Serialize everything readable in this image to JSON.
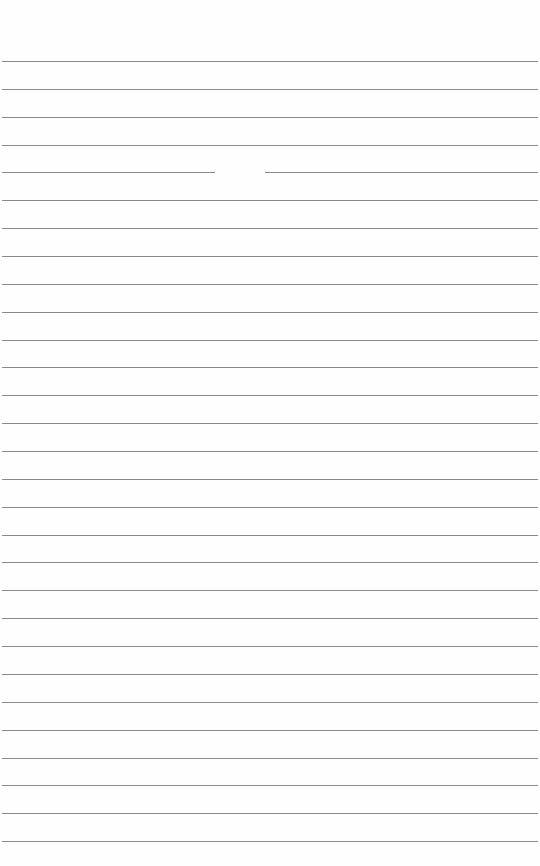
{
  "page": {
    "type": "lined-paper",
    "background_color": "#fefefe",
    "line_color": "#8a8a8a",
    "first_line_y": 61,
    "line_spacing": 27.86,
    "line_count": 29,
    "text": ""
  }
}
